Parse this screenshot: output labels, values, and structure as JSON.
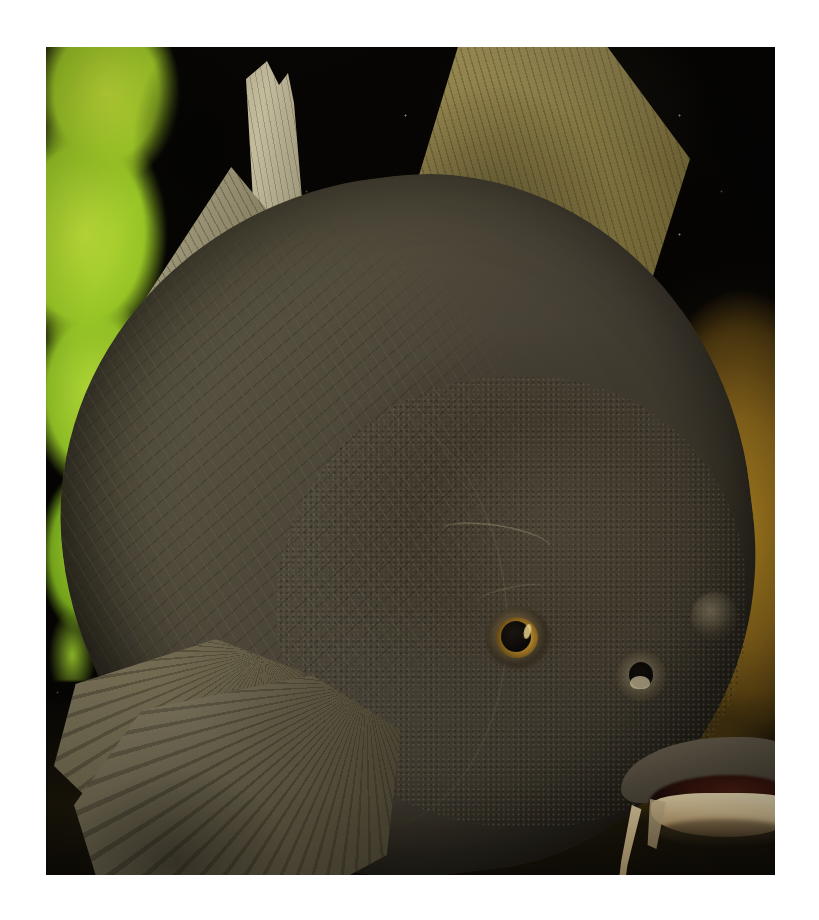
{
  "image": {
    "subject": "Common carp (Cyprinus carpio) in an aquarium",
    "alt_text": "Close-up photograph of a large dark olive-brown carp facing right, with a golden eye, pale cream lower lip, barbel, and fanned fins, against a black background with bright green plant at left and a golden-brown rock at right.",
    "orientation": "portrait",
    "frame": {
      "border_color": "#ffffff",
      "photo_left": 46,
      "photo_top": 47,
      "photo_width": 729,
      "photo_height": 828
    }
  },
  "palette": {
    "page_background": "#ffffff",
    "water_background": "#050403",
    "body_dark": "#3d382e",
    "body_mid": "#5d5744",
    "body_light": "#6c6650",
    "fin_olive": "#8d7f48",
    "fin_grey": "#756d52",
    "spine_pale": "#cdc6a6",
    "eye_iris_gold": "#d8a93c",
    "eye_pupil": "#0b0907",
    "lip_cream": "#f2e5c2",
    "mouth_interior": "#4b1d13",
    "plant_green": "#c4e63c",
    "rock_gold": "#a8801e",
    "substrate_brown": "#6d5a1c",
    "barbel_tan": "#d9c59a"
  },
  "features": [
    {
      "name": "dorsal-fin-large",
      "label": "Large dorsal fin",
      "color": "#8d7f48"
    },
    {
      "name": "dorsal-spine",
      "label": "Serrated dorsal spine",
      "color": "#cdc6a6"
    },
    {
      "name": "dorsal-fin-small",
      "label": "Secondary dorsal lobe",
      "color": "#8e8869"
    },
    {
      "name": "fish-body",
      "label": "Scaled body",
      "color": "#4c463a"
    },
    {
      "name": "gill-cover",
      "label": "Gill cover (operculum)",
      "color": "#544c3e"
    },
    {
      "name": "eye",
      "label": "Eye with golden iris",
      "color": "#d8a93c"
    },
    {
      "name": "nostril",
      "label": "Nostril",
      "color": "#120f0a"
    },
    {
      "name": "mouth",
      "label": "Mouth with cream lower lip",
      "color": "#f2e5c2"
    },
    {
      "name": "barbel",
      "label": "Barbel",
      "color": "#d9c59a"
    },
    {
      "name": "pectoral-fin",
      "label": "Pectoral fin",
      "color": "#756d52"
    },
    {
      "name": "pelvic-fin",
      "label": "Pelvic fin",
      "color": "#6d6650"
    },
    {
      "name": "aquatic-plant",
      "label": "Bright green aquatic plant",
      "color": "#c4e63c"
    },
    {
      "name": "rock",
      "label": "Golden-brown rock",
      "color": "#a8801e"
    },
    {
      "name": "substrate",
      "label": "Gravel substrate",
      "color": "#6d5a1c"
    }
  ]
}
